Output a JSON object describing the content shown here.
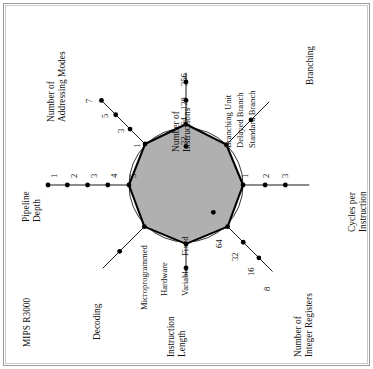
{
  "figure": {
    "title": "MIPS R3000",
    "type": "kiviat-radar"
  },
  "chart_data": {
    "type": "radar",
    "title": "MIPS R3000",
    "subtitle": "",
    "xlabel": "",
    "ylabel": "",
    "grid": false,
    "legend": "none",
    "note": "Kiviat diagram. Each axis is scaled so that values improve toward the outside; the shaded polygon is the MIPS R3000 profile. A thin reference circle is drawn at radius 1 normalized unit.",
    "reference_circle": {
      "shown": true,
      "normalized_radius": 0.62
    },
    "fill_color": "#b0b0b0",
    "line_color": "#000000",
    "axes": [
      {
        "name": "Number of Instructions",
        "label_lines": [
          "Number of",
          "Instructions"
        ],
        "angle_deg": 90,
        "kind": "numeric",
        "ticks": [
          "32",
          "64",
          "128",
          "256"
        ],
        "tick_order": "inner-to-outer",
        "value": "64",
        "value_index": 1,
        "normalized_value": 0.66
      },
      {
        "name": "Branching",
        "label_lines": [
          "Branching"
        ],
        "angle_deg": 45,
        "kind": "categorical",
        "group_label": "Branching Unit",
        "ticks": [
          "Delayed Branch",
          "Standard Branch"
        ],
        "tick_order": "inner-to-outer",
        "value": "Delayed Branch",
        "value_index": 0,
        "normalized_value": 0.62
      },
      {
        "name": "Cycles per Instruction",
        "label_lines": [
          "Cycles per",
          "Instruction"
        ],
        "angle_deg": 0,
        "kind": "numeric",
        "ticks": [
          "1",
          "2",
          "3"
        ],
        "tick_order": "inner-to-outer",
        "value": "1",
        "value_index": 0,
        "normalized_value": 0.62
      },
      {
        "name": "Number of Integer Registers",
        "label_lines": [
          "Number of",
          "Integer Registers"
        ],
        "angle_deg": -45,
        "kind": "numeric",
        "ticks": [
          "64",
          "32",
          "16",
          "8"
        ],
        "tick_order": "inner-to-outer",
        "value": "32",
        "value_index": 1,
        "normalized_value": 0.64
      },
      {
        "name": "Instruction Length",
        "label_lines": [
          "Instruction",
          "Length"
        ],
        "angle_deg": -90,
        "kind": "categorical",
        "ticks": [
          "Fixed",
          "Variable"
        ],
        "tick_order": "inner-to-outer",
        "value": "Fixed",
        "value_index": 0,
        "normalized_value": 0.64
      },
      {
        "name": "Decoding",
        "label_lines": [
          "Decoding"
        ],
        "angle_deg": -135,
        "kind": "categorical",
        "ticks": [
          "Hardware",
          "Microprogrammed"
        ],
        "tick_order": "inner-to-outer",
        "value": "Hardware",
        "value_index": 0,
        "normalized_value": 0.64
      },
      {
        "name": "Pipeline Depth",
        "label_lines": [
          "Pipeline",
          "Depth"
        ],
        "angle_deg": 180,
        "kind": "numeric",
        "ticks": [
          "5",
          "4",
          "3",
          "2",
          "1"
        ],
        "tick_order": "inner-to-outer",
        "value": "5",
        "value_index": 0,
        "normalized_value": 0.62
      },
      {
        "name": "Number of Addressing Modes",
        "label_lines": [
          "Number of",
          "Addressing Modes"
        ],
        "angle_deg": 135,
        "kind": "numeric",
        "ticks": [
          "1",
          "3",
          "5",
          "7"
        ],
        "tick_order": "inner-to-outer",
        "value": "1",
        "value_index": 0,
        "normalized_value": 0.63
      }
    ]
  },
  "labels": {
    "instructions_32": "32",
    "instructions_64": "64",
    "instructions_128": "128",
    "instructions_256": "256",
    "instructions_title_1": "Number of",
    "instructions_title_2": "Instructions",
    "branching_group": "Branching Unit",
    "branching_delayed": "Delayed Branch",
    "branching_standard": "Standard Branch",
    "branching_title": "Branching",
    "cpi_1": "1",
    "cpi_2": "2",
    "cpi_3": "3",
    "cpi_title_1": "Cycles per",
    "cpi_title_2": "Instruction",
    "regs_64": "64",
    "regs_32": "32",
    "regs_16": "16",
    "regs_8": "8",
    "regs_title_1": "Number of",
    "regs_title_2": "Integer Registers",
    "ilen_fixed": "Fixed",
    "ilen_variable": "Variable",
    "ilen_title_1": "Instruction",
    "ilen_title_2": "Length",
    "dec_hardware": "Hardware",
    "dec_micro": "Microprogrammed",
    "dec_title": "Decoding",
    "pipe_1": "1",
    "pipe_2": "2",
    "pipe_3": "3",
    "pipe_4": "4",
    "pipe_5": "5",
    "pipe_title_1": "Pipeline",
    "pipe_title_2": "Depth",
    "addr_1": "1",
    "addr_3": "3",
    "addr_5": "5",
    "addr_7": "7",
    "addr_title_1": "Number of",
    "addr_title_2": "Addressing Modes",
    "figure_title": "MIPS R3000"
  }
}
